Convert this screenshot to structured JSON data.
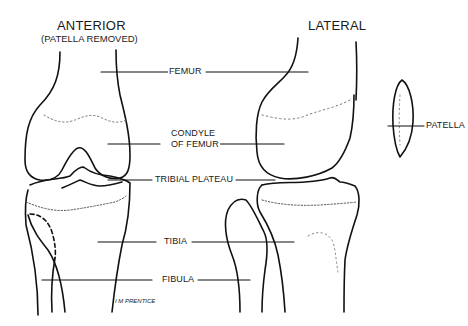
{
  "diagram": {
    "views": [
      {
        "id": "anterior",
        "title": "ANTERIOR",
        "subtitle": "(PATELLA REMOVED)"
      },
      {
        "id": "lateral",
        "title": "LATERAL"
      }
    ],
    "labels": {
      "femur": "FEMUR",
      "condyle_line1": "CONDYLE",
      "condyle_line2": "OF FEMUR",
      "tibial_plateau": "TRIBIAL PLATEAU",
      "patella": "PATELLA",
      "tibia": "TIBIA",
      "fibula": "FIBULA"
    },
    "signature": "I M PRENTICE",
    "colors": {
      "line": "#111111",
      "background": "#ffffff",
      "dotted": "#777777"
    }
  }
}
